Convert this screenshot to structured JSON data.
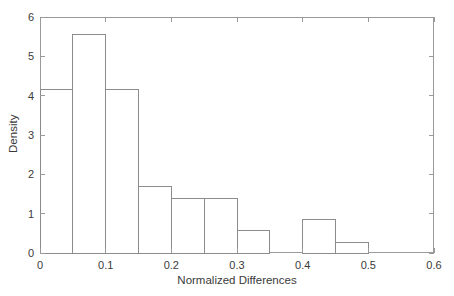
{
  "chart_data": {
    "type": "bar",
    "title": "",
    "subtitle": "",
    "xlabel": "Normalized Differences",
    "ylabel": "Density",
    "xlim": [
      0,
      0.6
    ],
    "ylim": [
      0,
      6
    ],
    "xticks": [
      0,
      0.1,
      0.2,
      0.3,
      0.4,
      0.5,
      0.6
    ],
    "xtick_labels": [
      "0",
      "0.1",
      "0.2",
      "0.3",
      "0.4",
      "0.5",
      "0.6"
    ],
    "yticks": [
      0,
      1,
      2,
      3,
      4,
      5,
      6
    ],
    "ytick_labels": [
      "0",
      "1",
      "2",
      "3",
      "4",
      "5",
      "6"
    ],
    "grid": false,
    "legend": null,
    "bin_width": 0.05,
    "bin_edges": [
      0,
      0.05,
      0.1,
      0.15,
      0.2,
      0.25,
      0.3,
      0.35,
      0.4,
      0.45,
      0.5
    ],
    "categories": [
      "0-0.05",
      "0.05-0.1",
      "0.1-0.15",
      "0.15-0.2",
      "0.2-0.25",
      "0.25-0.3",
      "0.3-0.35",
      "0.35-0.4",
      "0.4-0.45",
      "0.45-0.5"
    ],
    "values": [
      4.15,
      5.55,
      4.15,
      1.68,
      1.39,
      1.39,
      0.56,
      0,
      0.84,
      0.27
    ],
    "bar_color": "#ffffff",
    "bar_edge_color": "#8c8c8c",
    "axis_color": "#9a9a9a",
    "background_color": "#ffffff"
  }
}
